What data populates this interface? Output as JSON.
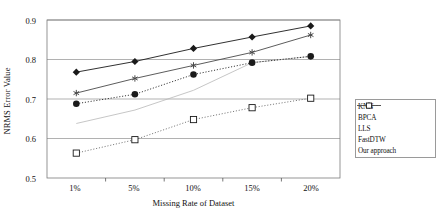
{
  "chart_data": {
    "type": "line",
    "title": "",
    "xlabel": "Missing Rate of Dataset",
    "ylabel": "NRMS Error Value",
    "categories": [
      "1%",
      "5%",
      "10%",
      "15%",
      "20%"
    ],
    "ylim": [
      0.5,
      0.9
    ],
    "yticks": [
      "0.5",
      "0.6",
      "0.7",
      "0.8",
      "0.9"
    ],
    "ytick_values": [
      0.5,
      0.6,
      0.7,
      0.8,
      0.9
    ],
    "grid": "horizontal",
    "legend_position": "right",
    "series": [
      {
        "name": "KNN",
        "values": [
          0.768,
          0.795,
          0.828,
          0.857,
          0.885
        ],
        "color": "#1a1a1a",
        "marker": "diamond",
        "line": "solid"
      },
      {
        "name": "BPCA",
        "values": [
          0.638,
          0.672,
          0.722,
          0.792,
          0.808
        ],
        "color": "#b8b8b8",
        "marker": "none",
        "line": "solid"
      },
      {
        "name": "LLS",
        "values": [
          0.715,
          0.752,
          0.785,
          0.818,
          0.862
        ],
        "color": "#4a4a4a",
        "marker": "asterisk",
        "line": "solid"
      },
      {
        "name": "FastDTW",
        "values": [
          0.688,
          0.712,
          0.762,
          0.792,
          0.808
        ],
        "color": "#1a1a1a",
        "marker": "circle",
        "line": "dotted"
      },
      {
        "name": "Our approach",
        "values": [
          0.563,
          0.597,
          0.648,
          0.678,
          0.702
        ],
        "color": "#6b6b6b",
        "marker": "square-open",
        "line": "dotted"
      }
    ]
  },
  "legend": {
    "entries": [
      {
        "label": "KNN"
      },
      {
        "label": "BPCA"
      },
      {
        "label": "LLS"
      },
      {
        "label": "FastDTW"
      },
      {
        "label": "Our approach"
      }
    ]
  }
}
